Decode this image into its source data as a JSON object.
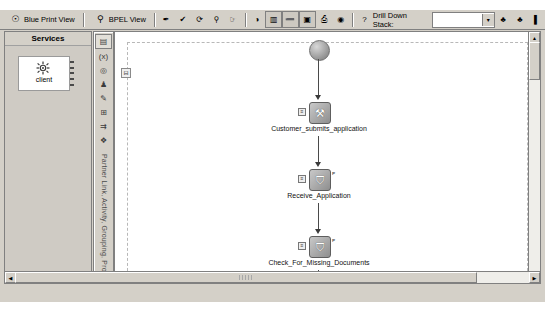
{
  "toolbar": {
    "blueprint_view": {
      "label": "Blue Print View",
      "icon": "blueprint-icon"
    },
    "bpel_view": {
      "label": "BPEL View",
      "icon": "bpel-icon"
    },
    "icons": [
      {
        "name": "wand-icon",
        "glyph": "✒"
      },
      {
        "name": "validate-check-icon",
        "glyph": "✔"
      },
      {
        "name": "refresh-icon",
        "glyph": "⟳"
      },
      {
        "name": "binoculars-icon",
        "glyph": "⚲"
      },
      {
        "name": "pointer-icon",
        "glyph": "☞"
      },
      {
        "name": "run-icon",
        "glyph": "◑"
      },
      {
        "name": "panel-split-icon",
        "glyph": "▥"
      },
      {
        "name": "minimize-panel-icon",
        "glyph": "➖"
      },
      {
        "name": "maximize-panel-icon",
        "glyph": "▣"
      },
      {
        "name": "print-icon",
        "glyph": "⎙"
      },
      {
        "name": "camera-icon",
        "glyph": "◉"
      },
      {
        "name": "help-icon",
        "glyph": "?"
      }
    ],
    "drill_down": {
      "label": "Drill Down Stack:",
      "value": "",
      "arrow": "▾",
      "nav_icons": [
        {
          "name": "drill-down-tree-icon",
          "glyph": "♣"
        },
        {
          "name": "drill-up-tree-icon",
          "glyph": "♣"
        },
        {
          "name": "drill-end-icon",
          "glyph": "▌"
        }
      ]
    }
  },
  "services": {
    "title": "Services",
    "item": {
      "label": "client",
      "icon": "gear-service-icon"
    }
  },
  "palette": {
    "icons": [
      {
        "name": "palette-select-icon",
        "glyph": "▤"
      },
      {
        "name": "palette-variable-icon",
        "glyph": "(x)"
      },
      {
        "name": "palette-circle-icon",
        "glyph": "◎"
      },
      {
        "name": "palette-partner-icon",
        "glyph": "♟"
      },
      {
        "name": "palette-assign-icon",
        "glyph": "✎"
      },
      {
        "name": "palette-scope-icon",
        "glyph": "⊞"
      },
      {
        "name": "palette-flow-icon",
        "glyph": "⇉"
      },
      {
        "name": "palette-pick-icon",
        "glyph": "❖"
      }
    ],
    "vertical_label": "Partner Link, Activity, Grouping, Process"
  },
  "canvas": {
    "collapse_toggle": "⊟",
    "nodes": [
      {
        "name": "start-node",
        "type": "start",
        "label": ""
      },
      {
        "name": "activity-node",
        "label": "Customer_submits_application",
        "glyph": "⚒",
        "badge_left": "≡",
        "badge_right": ""
      },
      {
        "name": "activity-node",
        "label": "Receive_Application",
        "glyph": "⛉",
        "badge_left": "≡",
        "badge_right": "ᴘ"
      },
      {
        "name": "activity-node",
        "label": "Check_For_Missing_Documents",
        "glyph": "⛉",
        "badge_left": "≡",
        "badge_right": "ᴘ"
      },
      {
        "name": "end-node",
        "label": "",
        "glyph": "⧉",
        "badge_left": "",
        "badge_right": ""
      }
    ]
  },
  "scrollbars": {
    "vertical": {
      "up": "▲",
      "down": "▼"
    },
    "horizontal": {
      "left": "◀",
      "right": "▶"
    }
  }
}
